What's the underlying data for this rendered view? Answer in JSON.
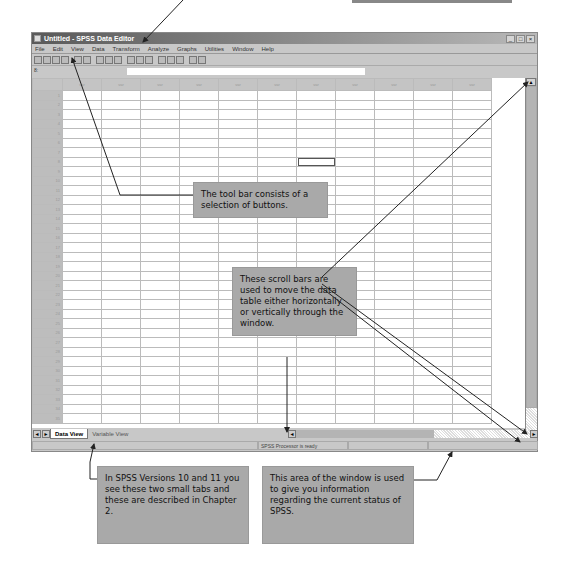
{
  "window": {
    "title": "Untitled - SPSS Data Editor",
    "controls": [
      "_",
      "□",
      "×"
    ]
  },
  "menubar": [
    "File",
    "Edit",
    "View",
    "Data",
    "Transform",
    "Analyze",
    "Graphs",
    "Utilities",
    "Window",
    "Help"
  ],
  "toolbar": {
    "button_count": 20
  },
  "cell_editor": {
    "cell_ref": "8:",
    "value": ""
  },
  "grid": {
    "column_header": "var",
    "column_count": 11,
    "rows": [
      "1",
      "2",
      "3",
      "4",
      "5",
      "6",
      "7",
      "8",
      "9",
      "10",
      "11",
      "12",
      "13",
      "14",
      "15",
      "16",
      "17",
      "18",
      "19",
      "20",
      "21",
      "22",
      "23",
      "24",
      "25",
      "26",
      "27",
      "28",
      "29",
      "30",
      "31",
      "32",
      "33",
      "34",
      "35"
    ],
    "selected_cell": {
      "row": 8,
      "col": 7
    }
  },
  "tabs": {
    "active": "Data View",
    "inactive": "Variable View"
  },
  "nav_buttons": [
    "◄",
    "►"
  ],
  "status": {
    "processor": "SPSS Processor  is ready"
  },
  "callouts": {
    "toolbar": "The tool bar consists of a selection of buttons.",
    "scrollbars": "These scroll bars are used to move the data table either horizontally or vertically through the window.",
    "tabs": "In SPSS Versions 10 and 11 you see these two small tabs and these are described in Chapter 2.",
    "status": "This area of the window is used to give you information regarding the current status of SPSS."
  }
}
